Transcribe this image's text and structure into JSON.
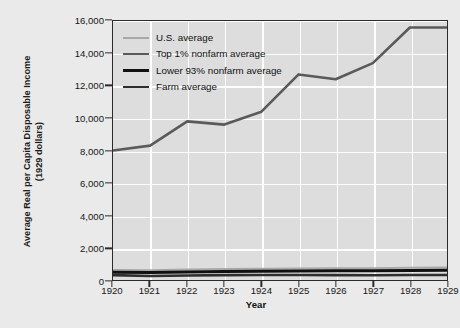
{
  "chart_data": {
    "type": "line",
    "title": "",
    "xlabel": "Year",
    "ylabel": "Average Real per Capita Disposable Income\n(1929 dollars)",
    "x": [
      1920,
      1921,
      1922,
      1923,
      1924,
      1925,
      1926,
      1927,
      1928,
      1929
    ],
    "xticklabels": [
      "1920",
      "1921",
      "1922",
      "1923",
      "1924",
      "1925",
      "1926",
      "1927",
      "1928",
      "1929"
    ],
    "yticklabels": [
      "0",
      "2,000",
      "4,000",
      "6,000",
      "8,000",
      "10,000",
      "12,000",
      "14,000",
      "16,000"
    ],
    "yticks": [
      0,
      2000,
      4000,
      6000,
      8000,
      10000,
      12000,
      14000,
      16000
    ],
    "xlim": [
      1920,
      1929
    ],
    "ylim": [
      0,
      16000
    ],
    "grid": true,
    "legend_position": "upper-left-inside",
    "series": [
      {
        "name": "U.S. average",
        "color": "#a8a8a8",
        "width": 2.1,
        "values": [
          610,
          600,
          640,
          680,
          690,
          710,
          730,
          725,
          760,
          770
        ]
      },
      {
        "name": "Top 1% nonfarm average",
        "color": "#5a5a5a",
        "width": 2.6,
        "values": [
          8000,
          8300,
          9800,
          9600,
          10400,
          12700,
          12400,
          13400,
          15600,
          15600
        ]
      },
      {
        "name": "Lower 93% nonfarm average",
        "color": "#101010",
        "width": 3.0,
        "values": [
          480,
          470,
          500,
          520,
          540,
          555,
          570,
          570,
          590,
          600
        ]
      },
      {
        "name": "Farm average",
        "color": "#2e2e2e",
        "width": 2.6,
        "values": [
          300,
          250,
          280,
          300,
          305,
          310,
          300,
          295,
          305,
          310
        ]
      }
    ]
  },
  "legend": {
    "items": [
      {
        "label": "U.S. average"
      },
      {
        "label": "Top 1% nonfarm average"
      },
      {
        "label": "Lower 93% nonfarm average"
      },
      {
        "label": "Farm average"
      }
    ]
  }
}
